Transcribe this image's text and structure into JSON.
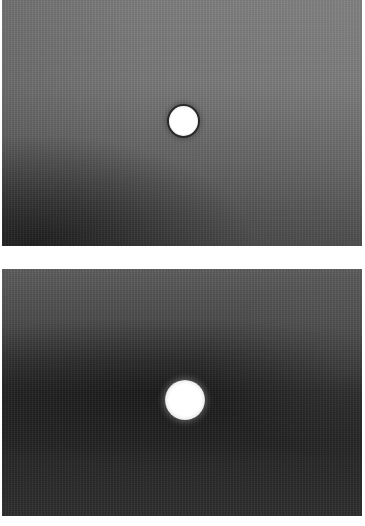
{
  "figure": {
    "panels": [
      {
        "id": "top",
        "description": "Grayscale photograph: single bright circular spot with dark rim on a mid-gray background, darker toward bottom-left",
        "background_colors": {
          "top": "#7c7c7c",
          "bottom": "#454545",
          "bottom_left_corner": "#2e2e2e"
        },
        "spot": {
          "center": [
            183,
            120
          ],
          "radius_px": 14,
          "color": "#ffffff",
          "rim_color": "#2a2a2a"
        }
      },
      {
        "id": "bottom",
        "description": "Grayscale photograph: larger, softer bright circular spot on a darker background with a dark horizontal band",
        "background_colors": {
          "top": "#5c5c5c",
          "middle": "#262626",
          "bottom": "#2e2e2e"
        },
        "spot": {
          "center": [
            185,
            399
          ],
          "radius_px": 19,
          "color": "#ffffff",
          "glow_color": "#bdbdbd"
        }
      }
    ],
    "separator_color": "#ffffff"
  }
}
